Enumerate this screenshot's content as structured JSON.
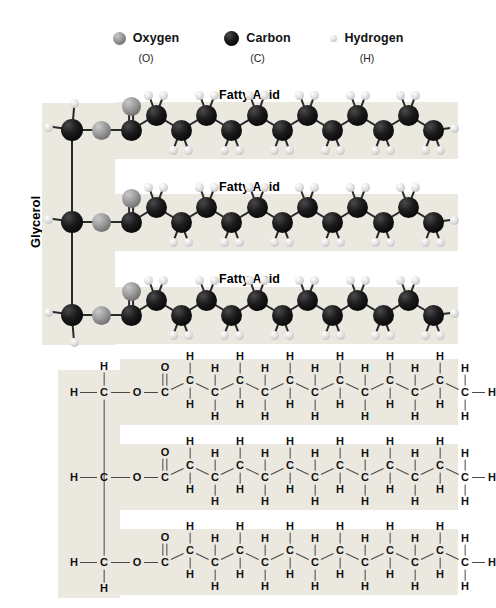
{
  "legend": {
    "items": [
      {
        "name": "Oxygen",
        "abbr": "(O)",
        "icon": "oxygen-sphere-icon",
        "color": "#8d8d8d",
        "size": 13
      },
      {
        "name": "Carbon",
        "abbr": "(C)",
        "icon": "carbon-sphere-icon",
        "color": "#0a0a0a",
        "size": 15
      },
      {
        "name": "Hydrogen",
        "abbr": "(H)",
        "icon": "hydrogen-sphere-icon",
        "color": "#d8d8d8",
        "size": 7
      }
    ]
  },
  "labels": {
    "glycerol": "Glycerol",
    "fatty_acid": "Fatty Acid",
    "fatty_acid_titles": [
      "Fatty Acid",
      "Fatty Acid",
      "Fatty Acid"
    ]
  },
  "atoms": {
    "oxygen": "O",
    "carbon": "C",
    "hydrogen": "H"
  },
  "colors": {
    "panel_background": "#ebe8e0",
    "page_background": "#ffffff",
    "bond": "#2a2a2a",
    "text": "#111111",
    "carbon_fill": "#0a0a0a",
    "oxygen_fill": "#8d8d8d",
    "hydrogen_fill": "#d8d8d8"
  },
  "structure": {
    "molecule": "triglyceride",
    "glycerol_carbons": 3,
    "fatty_acid_count": 3,
    "fatty_acid_chain_carbons": 13,
    "ester_oxygen_label": "O",
    "carbonyl_oxygen_label": "O",
    "terminal_hydrogen_label": "H"
  },
  "structural_formula": {
    "glycerol_rows": [
      {
        "left_h": "H",
        "carbon": "C",
        "ester_o": "O",
        "vertical_h": "H",
        "vertical_h_position": "top"
      },
      {
        "left_h": "H",
        "carbon": "C",
        "ester_o": "O",
        "vertical_h": null,
        "vertical_h_position": "none"
      },
      {
        "left_h": "H",
        "carbon": "C",
        "ester_o": "O",
        "vertical_h": "H",
        "vertical_h_position": "bottom"
      }
    ],
    "chain": {
      "carbonyl": {
        "carbon": "C",
        "double_bond_o": "O"
      },
      "methylene_carbons": 12,
      "methylene_carbon_label": "C",
      "hydrogen_label": "H",
      "terminal_h": "H"
    }
  },
  "model_rows": [
    {
      "title": "Fatty Acid",
      "carbons": 13,
      "carbonyl_oxygen": true
    },
    {
      "title": "Fatty Acid",
      "carbons": 13,
      "carbonyl_oxygen": true
    },
    {
      "title": "Fatty Acid",
      "carbons": 13,
      "carbonyl_oxygen": true
    }
  ]
}
